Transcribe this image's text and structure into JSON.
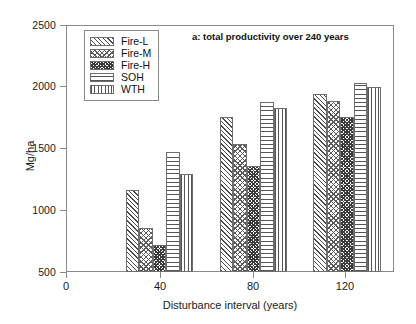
{
  "chart_data": {
    "type": "bar",
    "title": "a: total productivity over 240 years",
    "xlabel": "Disturbance interval (years)",
    "ylabel": "Mg/ha",
    "grid": false,
    "legend_position": "top-left",
    "categories": [
      "40",
      "80",
      "120"
    ],
    "x": [
      40,
      80,
      120
    ],
    "xlim": [
      0,
      140
    ],
    "ylim": [
      500,
      2500
    ],
    "xticks": [
      0,
      40,
      80,
      120
    ],
    "yticks": [
      500,
      1000,
      1500,
      2000,
      2500
    ],
    "series": [
      {
        "name": "Fire-L",
        "pattern": "diagonal-hatch",
        "values": [
          1165,
          1755,
          1940
        ]
      },
      {
        "name": "Fire-M",
        "pattern": "cross-hatch-light",
        "values": [
          860,
          1535,
          1885
        ]
      },
      {
        "name": "Fire-H",
        "pattern": "cross-hatch-dense",
        "values": [
          715,
          1360,
          1755
        ]
      },
      {
        "name": "SOH",
        "pattern": "horizontal-lines",
        "values": [
          1470,
          1880,
          2030
        ]
      },
      {
        "name": "WTH",
        "pattern": "vertical-lines",
        "values": [
          1290,
          1825,
          2000
        ]
      }
    ]
  },
  "axes": {
    "y_tick_labels": [
      "2500",
      "2000",
      "1500",
      "1000",
      "500"
    ],
    "x_tick_labels": [
      "0",
      "40",
      "80",
      "120"
    ]
  }
}
